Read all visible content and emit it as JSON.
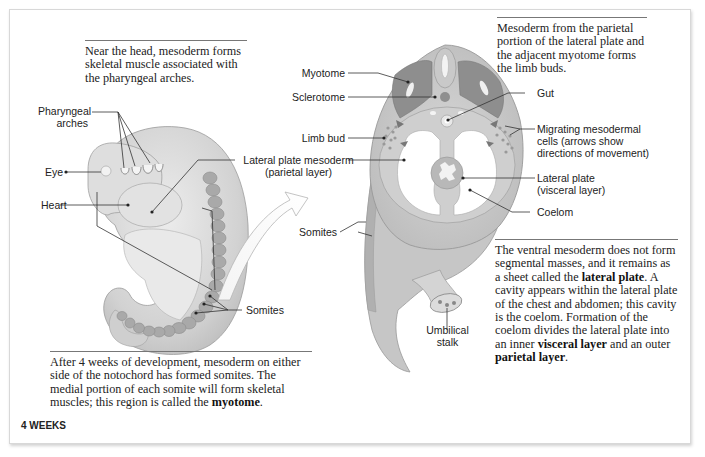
{
  "figure": {
    "stage_label": "4 WEEKS",
    "captions": {
      "head": "Near the head, mesoderm forms skeletal muscle associated with the pharyngeal arches.",
      "limb": "Mesoderm from the parietal portion of the lateral plate and the adjacent myotome forms the limb buds.",
      "somites_part1": "After 4 weeks of development, mesoderm on either side of the notochord has formed somites. The medial portion of each somite will form skeletal muscles; this region is called the ",
      "somites_bold": "myotome",
      "somites_end": ".",
      "ventral_part1": "The ventral mesoderm does not form segmental masses, and it remains as a sheet called the ",
      "ventral_bold1": "lateral plate",
      "ventral_part2": ". A cavity appears within the lateral plate of the chest and abdomen; this cavity is the coelom. Formation of the coelom divides the lateral plate into an inner ",
      "ventral_bold2": "visceral layer",
      "ventral_part3": " and an outer ",
      "ventral_bold3": "parietal layer",
      "ventral_end": "."
    },
    "left_labels": {
      "pharyngeal_1": "Pharyngeal",
      "pharyngeal_2": "arches",
      "eye": "Eye",
      "heart": "Heart",
      "lateral_plate_1": "Lateral plate mesoderm",
      "lateral_plate_2": "(parietal layer)",
      "somites": "Somites"
    },
    "right_labels": {
      "myotome": "Myotome",
      "sclerotome": "Sclerotome",
      "limb_bud": "Limb bud",
      "somites": "Somites",
      "gut": "Gut",
      "migrating_1": "Migrating mesodermal",
      "migrating_2": "cells (arrows show",
      "migrating_3": "directions of movement)",
      "lateral_visceral_1": "Lateral plate",
      "lateral_visceral_2": "(visceral layer)",
      "coelom": "Coelom",
      "umbilical_1": "Umbilical",
      "umbilical_2": "stalk"
    },
    "colors": {
      "embryo_fill": "#d4d4d4",
      "embryo_light": "#e6e6e6",
      "somite": "#a9a9a9",
      "myotome": "#8e8e8e",
      "leader_line": "#333333"
    }
  }
}
